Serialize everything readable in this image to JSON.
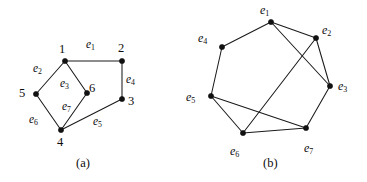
{
  "figure": {
    "panels": [
      {
        "id": "a",
        "caption": "(a)",
        "caption_x": 76,
        "caption_y": 157,
        "type": "graph",
        "vertex_labels": [
          {
            "name": "vertex-label-1",
            "text": "1",
            "x": 59,
            "y": 43
          },
          {
            "name": "vertex-label-2",
            "text": "2",
            "x": 118,
            "y": 42
          },
          {
            "name": "vertex-label-3",
            "text": "3",
            "x": 128,
            "y": 95
          },
          {
            "name": "vertex-label-4",
            "text": "4",
            "x": 57,
            "y": 136
          },
          {
            "name": "vertex-label-5",
            "text": "5",
            "x": 19,
            "y": 87
          },
          {
            "name": "vertex-label-6",
            "text": "6",
            "x": 89,
            "y": 82
          }
        ],
        "vertices": [
          {
            "id": "1",
            "x": 65,
            "y": 61
          },
          {
            "id": "2",
            "x": 122,
            "y": 61
          },
          {
            "id": "3",
            "x": 122,
            "y": 99
          },
          {
            "id": "4",
            "x": 61,
            "y": 130
          },
          {
            "id": "5",
            "x": 36,
            "y": 94
          },
          {
            "id": "6",
            "x": 87,
            "y": 93
          }
        ],
        "edges": [
          {
            "id": "e1",
            "from": "1",
            "to": "2",
            "label": "e",
            "sub": "1",
            "lx": 86,
            "ly": 39
          },
          {
            "id": "e2",
            "from": "1",
            "to": "5",
            "label": "e",
            "sub": "2",
            "lx": 33,
            "ly": 63
          },
          {
            "id": "e3",
            "from": "1",
            "to": "6",
            "label": "e",
            "sub": "3",
            "lx": 60,
            "ly": 78
          },
          {
            "id": "e4",
            "from": "2",
            "to": "3",
            "label": "e",
            "sub": "4",
            "lx": 126,
            "ly": 74
          },
          {
            "id": "e5",
            "from": "3",
            "to": "4",
            "label": "e",
            "sub": "5",
            "lx": 93,
            "ly": 116
          },
          {
            "id": "e6",
            "from": "5",
            "to": "4",
            "label": "e",
            "sub": "6",
            "lx": 29,
            "ly": 114
          },
          {
            "id": "e7",
            "from": "6",
            "to": "4",
            "label": "e",
            "sub": "7",
            "lx": 62,
            "ly": 101
          }
        ]
      },
      {
        "id": "b",
        "caption": "(b)",
        "caption_x": 263,
        "caption_y": 157,
        "type": "line-graph",
        "vertices": [
          {
            "id": "e1",
            "x": 271,
            "y": 22
          },
          {
            "id": "e2",
            "x": 316,
            "y": 38
          },
          {
            "id": "e3",
            "x": 330,
            "y": 86
          },
          {
            "id": "e4",
            "x": 222,
            "y": 47
          },
          {
            "id": "e5",
            "x": 211,
            "y": 96
          },
          {
            "id": "e6",
            "x": 243,
            "y": 133
          },
          {
            "id": "e7",
            "x": 306,
            "y": 128
          }
        ],
        "vertex_labels": [
          {
            "name": "node-label-e1",
            "text": "e",
            "sub": "1",
            "x": 260,
            "y": 4
          },
          {
            "name": "node-label-e2",
            "text": "e",
            "sub": "2",
            "x": 322,
            "y": 24
          },
          {
            "name": "node-label-e3",
            "text": "e",
            "sub": "3",
            "x": 338,
            "y": 80
          },
          {
            "name": "node-label-e4",
            "text": "e",
            "sub": "4",
            "x": 198,
            "y": 32
          },
          {
            "name": "node-label-e5",
            "text": "e",
            "sub": "5",
            "x": 186,
            "y": 91
          },
          {
            "name": "node-label-e6",
            "text": "e",
            "sub": "6",
            "x": 230,
            "y": 145
          },
          {
            "name": "node-label-e7",
            "text": "e",
            "sub": "7",
            "x": 304,
            "y": 142
          }
        ],
        "edges": [
          {
            "from": "e1",
            "to": "e4"
          },
          {
            "from": "e1",
            "to": "e2"
          },
          {
            "from": "e1",
            "to": "e3"
          },
          {
            "from": "e2",
            "to": "e3"
          },
          {
            "from": "e2",
            "to": "e6"
          },
          {
            "from": "e3",
            "to": "e7"
          },
          {
            "from": "e4",
            "to": "e5"
          },
          {
            "from": "e5",
            "to": "e6"
          },
          {
            "from": "e5",
            "to": "e7"
          },
          {
            "from": "e6",
            "to": "e7"
          }
        ]
      }
    ],
    "style": {
      "stroke": "#1a1a1a",
      "vertex_fill": "#111111",
      "background": "#ffffff",
      "vertex_radius": 2.6
    }
  }
}
